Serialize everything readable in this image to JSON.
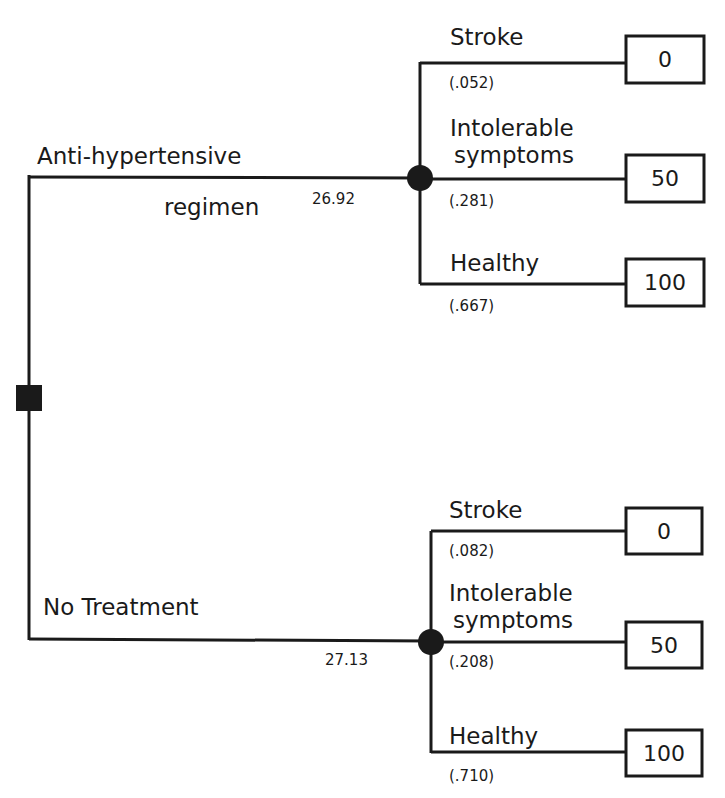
{
  "diagram": {
    "type": "decision-tree",
    "decision_node": {
      "shape": "square"
    },
    "branches": [
      {
        "label_line1": "Anti-hypertensive",
        "label_line2": "regimen",
        "expected_value": "26.92",
        "outcomes": [
          {
            "label_line1": "Stroke",
            "label_line2": "",
            "probability": "(.052)",
            "value": "0"
          },
          {
            "label_line1": "Intolerable",
            "label_line2": "symptoms",
            "probability": "(.281)",
            "value": "50"
          },
          {
            "label_line1": "Healthy",
            "label_line2": "",
            "probability": "(.667)",
            "value": "100"
          }
        ]
      },
      {
        "label_line1": "No Treatment",
        "label_line2": "",
        "expected_value": "27.13",
        "outcomes": [
          {
            "label_line1": "Stroke",
            "label_line2": "",
            "probability": "(.082)",
            "value": "0"
          },
          {
            "label_line1": "Intolerable",
            "label_line2": "symptoms",
            "probability": "(.208)",
            "value": "50"
          },
          {
            "label_line1": "Healthy",
            "label_line2": "",
            "probability": "(.710)",
            "value": "100"
          }
        ]
      }
    ],
    "colors": {
      "ink": "#1a1a1a",
      "background": "#ffffff"
    }
  }
}
